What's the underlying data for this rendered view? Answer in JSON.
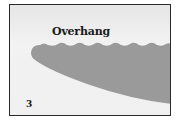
{
  "figure": {
    "title": "Overhang",
    "panel_number": "3"
  },
  "colors": {
    "frame": "#2a2a2a",
    "background": "#f0f0f0",
    "rock": "#999999",
    "text": "#1a1a1a"
  }
}
